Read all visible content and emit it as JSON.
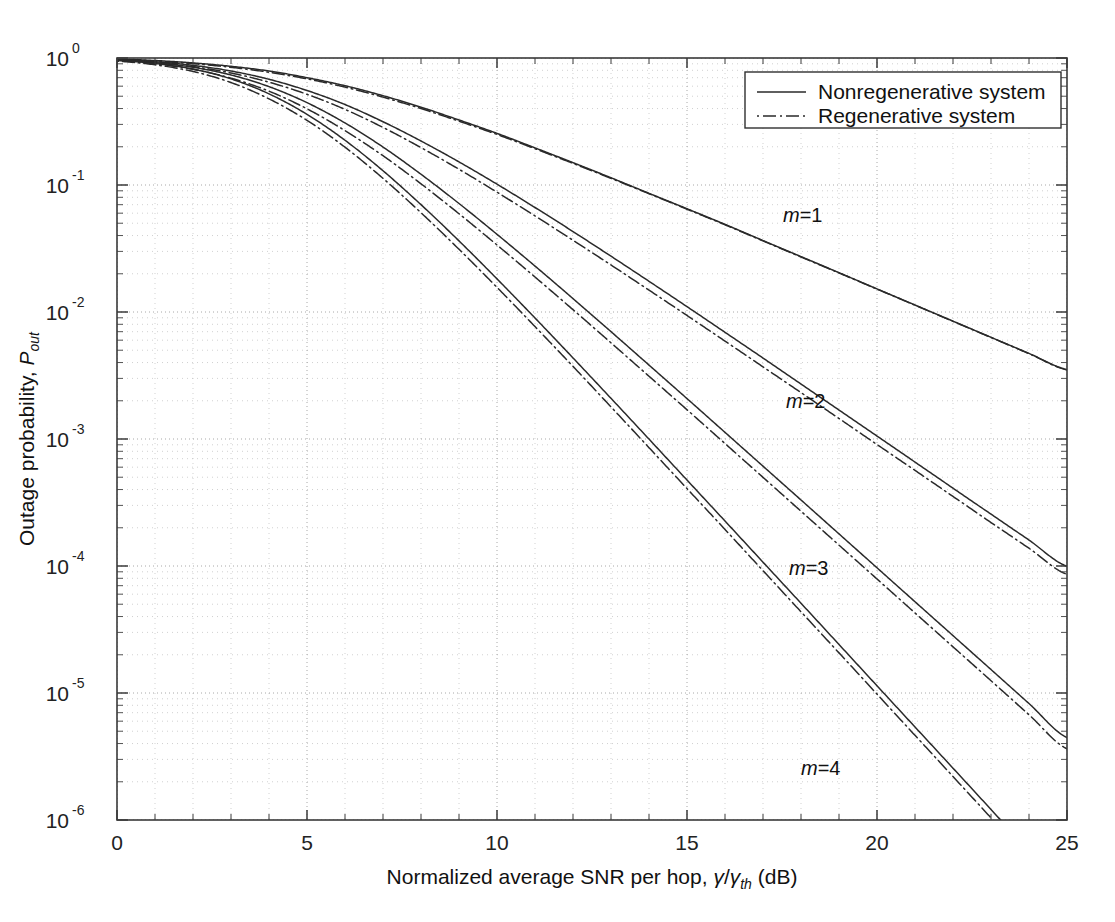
{
  "figure": {
    "background": "#ffffff",
    "line_color": "#2a2a2a",
    "grid_color": "#bdbdbd",
    "axis_color": "#3a3a3a"
  },
  "axes": {
    "x": {
      "label_prefix": "Normalized average SNR per hop, ",
      "label_symbol_num": "γ",
      "label_symbol_slash": "/",
      "label_symbol_den": "γ",
      "label_symbol_den_sub": "th",
      "label_suffix": " (dB)",
      "ticks": [
        "0",
        "5",
        "10",
        "15",
        "20",
        "25"
      ],
      "range": [
        0,
        25
      ],
      "scale": "linear"
    },
    "y": {
      "label_main": "Outage probability, ",
      "label_symbol": "P",
      "label_symbol_sub": "out",
      "ticks": [
        "10",
        "10",
        "10",
        "10",
        "10",
        "10",
        "10"
      ],
      "tick_exponents": [
        "0",
        "-1",
        "-2",
        "-3",
        "-4",
        "-5",
        "-6"
      ],
      "range": [
        1e-06,
        1
      ],
      "scale": "log"
    }
  },
  "legend": {
    "position": "top-right",
    "items": [
      {
        "label": "Nonregenerative system",
        "style": "solid"
      },
      {
        "label": "Regenerative system",
        "style": "dashdot"
      }
    ]
  },
  "annotations": [
    {
      "name": "m-1",
      "text_italic": "m",
      "text_rest": "=1",
      "x_px": 783,
      "y_px": 222
    },
    {
      "name": "m-2",
      "text_italic": "m",
      "text_rest": "=2",
      "x_px": 786,
      "y_px": 408
    },
    {
      "name": "m-3",
      "text_italic": "m",
      "text_rest": "=3",
      "x_px": 789,
      "y_px": 575
    },
    {
      "name": "m-4",
      "text_italic": "m",
      "text_rest": "=4",
      "x_px": 801,
      "y_px": 775
    }
  ],
  "chart_data": {
    "type": "line",
    "title": "",
    "xlabel": "Normalized average SNR per hop, γ/γ_th (dB)",
    "ylabel": "Outage probability, P_out",
    "xlim": [
      0,
      25
    ],
    "ylim": [
      1e-06,
      1
    ],
    "yscale": "log",
    "grid": true,
    "legend": [
      "Nonregenerative system",
      "Regenerative system"
    ],
    "x": [
      0,
      1,
      2,
      3,
      4,
      5,
      6,
      7,
      8,
      9,
      10,
      11,
      12,
      13,
      14,
      15,
      16,
      17,
      18,
      19,
      20,
      21,
      22,
      23,
      24,
      25
    ],
    "series": [
      {
        "name": "Nonregenerative m=1",
        "style": "solid",
        "m": 1,
        "values": [
          0.98,
          0.955,
          0.915,
          0.86,
          0.79,
          0.7,
          0.605,
          0.505,
          0.41,
          0.325,
          0.255,
          0.196,
          0.15,
          0.114,
          0.086,
          0.065,
          0.049,
          0.0365,
          0.0273,
          0.0204,
          0.0152,
          0.01135,
          0.00847,
          0.00632,
          0.00472,
          0.00352
        ]
      },
      {
        "name": "Regenerative m=1",
        "style": "dashdot",
        "m": 1,
        "values": [
          0.975,
          0.945,
          0.902,
          0.845,
          0.772,
          0.685,
          0.59,
          0.492,
          0.4,
          0.318,
          0.25,
          0.193,
          0.148,
          0.1128,
          0.0854,
          0.0645,
          0.0486,
          0.0363,
          0.0271,
          0.0203,
          0.01515,
          0.01131,
          0.00844,
          0.0063,
          0.0047,
          0.0035
        ]
      },
      {
        "name": "Nonregenerative m=2",
        "style": "solid",
        "m": 2,
        "values": [
          0.97,
          0.935,
          0.875,
          0.79,
          0.68,
          0.555,
          0.43,
          0.315,
          0.222,
          0.152,
          0.1015,
          0.0665,
          0.043,
          0.0275,
          0.01745,
          0.01102,
          0.00692,
          0.00434,
          0.00271,
          0.00169,
          0.001055,
          0.000658,
          0.00041,
          0.000256,
          0.00016,
          9.95e-05
        ]
      },
      {
        "name": "Regenerative m=2",
        "style": "dashdot",
        "m": 2,
        "values": [
          0.962,
          0.922,
          0.855,
          0.762,
          0.645,
          0.518,
          0.394,
          0.284,
          0.197,
          0.133,
          0.0878,
          0.0571,
          0.0367,
          0.02345,
          0.01487,
          0.00939,
          0.0059,
          0.0037,
          0.00232,
          0.00145,
          0.000905,
          0.000566,
          0.000353,
          0.00022,
          0.000138,
          8.6e-05
        ]
      },
      {
        "name": "Nonregenerative m=3",
        "style": "solid",
        "m": 3,
        "values": [
          0.962,
          0.918,
          0.845,
          0.735,
          0.595,
          0.445,
          0.308,
          0.199,
          0.1215,
          0.0715,
          0.0409,
          0.023,
          0.01275,
          0.007,
          0.00382,
          0.00208,
          0.001128,
          0.000611,
          0.000331,
          0.000179,
          9.68e-05,
          5.23e-05,
          2.83e-05,
          1.53e-05,
          8.26e-06,
          4.46e-06
        ]
      },
      {
        "name": "Regenerative m=3",
        "style": "dashdot",
        "m": 3,
        "values": [
          0.952,
          0.9,
          0.815,
          0.694,
          0.548,
          0.398,
          0.268,
          0.17,
          0.1022,
          0.0594,
          0.0337,
          0.01885,
          0.01043,
          0.00572,
          0.00312,
          0.0017,
          0.000921,
          0.000499,
          0.00027,
          0.000146,
          7.9e-05,
          4.27e-05,
          2.31e-05,
          1.25e-05,
          6.74e-06,
          3.64e-06
        ]
      },
      {
        "name": "Nonregenerative m=4",
        "style": "solid",
        "m": 4,
        "values": [
          0.955,
          0.905,
          0.818,
          0.685,
          0.522,
          0.36,
          0.225,
          0.1295,
          0.07,
          0.0363,
          0.01823,
          0.00897,
          0.00435,
          0.00209,
          0.000998,
          0.000475,
          0.000226,
          0.0001072,
          5.09e-05,
          2.41e-05,
          1.14e-05,
          5.4e-06,
          2.56e-06,
          1.21e-06,
          5.7e-07,
          2.7e-07
        ]
      },
      {
        "name": "Regenerative m=4",
        "style": "dashdot",
        "m": 4,
        "values": [
          0.944,
          0.884,
          0.784,
          0.641,
          0.477,
          0.323,
          0.1985,
          0.1128,
          0.0605,
          0.03118,
          0.01563,
          0.00768,
          0.00373,
          0.00179,
          0.000855,
          0.000407,
          0.000194,
          9.19e-05,
          4.36e-05,
          2.07e-05,
          9.8e-06,
          4.64e-06,
          2.2e-06,
          1.04e-06,
          4.9e-07,
          2.3e-07
        ]
      }
    ]
  }
}
